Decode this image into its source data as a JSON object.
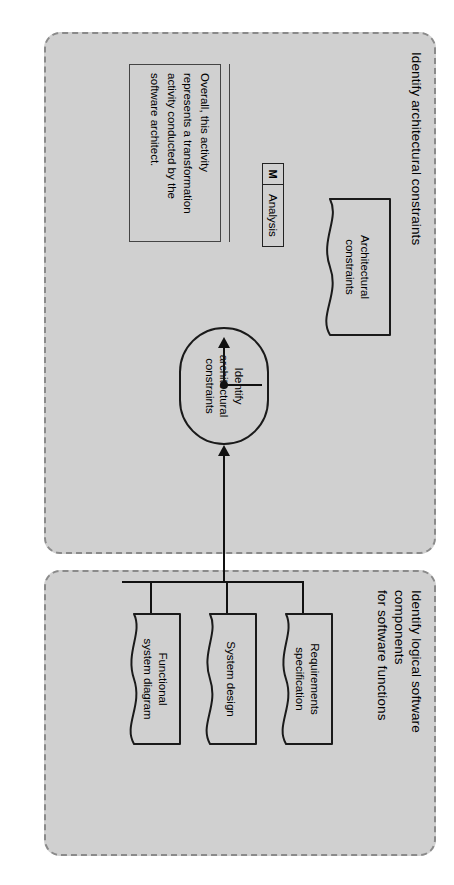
{
  "diagram": {
    "type": "uml-activity-diagram",
    "orientation": "page rotated 90 degrees clockwise",
    "colors": {
      "partition_fill": "#d0d0d0",
      "partition_border": "#8a8a8a",
      "shape_border": "#1a1a1a",
      "connector": "#111111",
      "page_background": "#ffffff"
    }
  },
  "partitions": [
    {
      "id": "identify-architectural-constraints",
      "title": "Identify architectural constraints"
    },
    {
      "id": "identify-logical-software-components",
      "title": "Identify logical software\ncomponents\nfor software functions"
    }
  ],
  "note": {
    "text": "Overall, this activity\nrepresents a transformation\nactivity conducted by the\nsoftware architect."
  },
  "activity": {
    "label": "Identify\narchitectural\nconstraints"
  },
  "tag": {
    "marker": "M",
    "name": "Analysis"
  },
  "artifacts": [
    {
      "id": "architectural-constraints",
      "label": "Architectural\nconstraints"
    },
    {
      "id": "requirements-specification",
      "label": "Requirements\nspecification"
    },
    {
      "id": "system-design",
      "label": "System design"
    },
    {
      "id": "functional-system-diagram",
      "label": "Functional\nsystem diagram"
    }
  ],
  "connectors": [
    {
      "from": "identify-architectural-constraints",
      "to": "architectural-constraints",
      "kind": "output-flow"
    },
    {
      "from": "analysis-tag",
      "to": "output-flow-junction",
      "kind": "stereotype-link"
    },
    {
      "from": "requirements-specification",
      "to": "identify-architectural-constraints",
      "kind": "input-flow"
    },
    {
      "from": "system-design",
      "to": "identify-architectural-constraints",
      "kind": "input-flow"
    },
    {
      "from": "functional-system-diagram",
      "to": "identify-architectural-constraints",
      "kind": "input-flow"
    }
  ]
}
